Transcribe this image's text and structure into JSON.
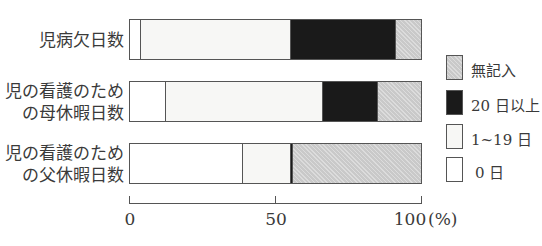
{
  "chart_data": {
    "type": "bar",
    "orientation": "horizontal",
    "stacked": true,
    "percent": true,
    "title": "",
    "xlabel": "",
    "ylabel": "",
    "xlim": [
      0,
      100
    ],
    "x_ticks": [
      "0",
      "50",
      "100"
    ],
    "x_unit": "(%)",
    "grid": false,
    "legend_position": "right",
    "categories": [
      "児病欠日数",
      "児の看護のための母休暇日数",
      "児の看護のための父休暇日数"
    ],
    "category_lines": [
      [
        "児病欠日数"
      ],
      [
        "児の看護のため",
        "の母休暇日数"
      ],
      [
        "児の看護のため",
        "の父休暇日数"
      ]
    ],
    "series": [
      {
        "name": "0 日",
        "values": [
          3.5,
          12,
          38.5
        ],
        "color": "#ffffff"
      },
      {
        "name": "1~19 日",
        "values": [
          51.5,
          54,
          16.5
        ],
        "color": "#f7f7f5"
      },
      {
        "name": "20 日以上",
        "values": [
          36,
          19,
          0.7
        ],
        "color": "#1a1a1a"
      },
      {
        "name": "無記入",
        "values": [
          9,
          15,
          44.3
        ],
        "color": "#c9c9c9"
      }
    ],
    "legend_order": [
      "無記入",
      "20 日以上",
      "1~19 日",
      "0 日"
    ]
  },
  "labels": {
    "cat0_l1": "児病欠日数",
    "cat1_l1": "児の看護のため",
    "cat1_l2": "の母休暇日数",
    "cat2_l1": "児の看護のため",
    "cat2_l2": "の父休暇日数",
    "tick0": "0",
    "tick50": "50",
    "tick100": "100",
    "unit": "(%)",
    "legend_none": "無記入",
    "legend_20": "20 日以上",
    "legend_1_19": "1~19 日",
    "legend_0": "0 日"
  }
}
